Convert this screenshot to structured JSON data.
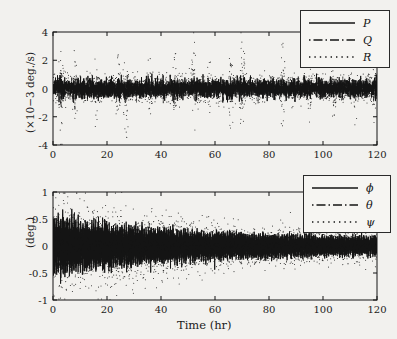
{
  "figure": {
    "background_color": "#f2f1ee",
    "ink_color": "#141414"
  },
  "xaxis": {
    "label": "Time (hr)",
    "ticks": [
      0,
      20,
      40,
      60,
      80,
      100,
      120
    ],
    "tick_labels": [
      "0",
      "20",
      "40",
      "60",
      "80",
      "100",
      "120"
    ],
    "min": 0,
    "max": 120
  },
  "top_panel": {
    "ylabel": "(×10−3 deg./s)",
    "ytick_labels": [
      "-4",
      "-2",
      "0",
      "2",
      "4"
    ],
    "legend": {
      "items": [
        {
          "label": "P",
          "style": "solid"
        },
        {
          "label": "Q",
          "style": "dashdot"
        },
        {
          "label": "R",
          "style": "dotted"
        }
      ]
    }
  },
  "bottom_panel": {
    "ylabel": "(deg.)",
    "ytick_labels": [
      "-1",
      "-0.5",
      "0",
      "0.5",
      "1"
    ],
    "legend": {
      "items": [
        {
          "label": "ϕ",
          "style": "solid"
        },
        {
          "label": "θ",
          "style": "dashdot"
        },
        {
          "label": "ψ",
          "style": "dotted"
        }
      ]
    }
  },
  "chart_data": [
    {
      "type": "line",
      "panel": "top",
      "title": "",
      "xlabel": "",
      "ylabel": "(×10−3 deg./s)",
      "xlim": [
        0,
        120
      ],
      "ylim": [
        -4,
        4
      ],
      "xticks": [
        0,
        20,
        40,
        60,
        80,
        100,
        120
      ],
      "yticks": [
        -4,
        -2,
        0,
        2,
        4
      ],
      "grid": false,
      "legend_position": "top-right-outside",
      "series": [
        {
          "name": "P",
          "style": "solid",
          "description": "dense zero-mean high-frequency noise band",
          "mean": 0.0,
          "envelope_amplitude": 0.75,
          "samples": 2400
        },
        {
          "name": "Q",
          "style": "dashdot",
          "description": "zero-mean noise with occasional moderate excursions",
          "mean": 0.0,
          "envelope_amplitude": 0.6,
          "samples": 2400
        },
        {
          "name": "R",
          "style": "dotted",
          "description": "zero-mean noise with periodic large spike clusters reaching +/-3.6",
          "mean": 0.0,
          "baseline_amplitude": 0.8,
          "spike_peak": 3.6,
          "spike_centers_hr": [
            3,
            8,
            16,
            24,
            27,
            36,
            45,
            52,
            58,
            66,
            70,
            85,
            95,
            104,
            112,
            119
          ],
          "spike_magnitudes": [
            3.6,
            2.3,
            1.6,
            2.6,
            3.3,
            2.2,
            2.0,
            2.6,
            1.5,
            2.6,
            3.6,
            2.3,
            2.2,
            2.0,
            1.6,
            1.7
          ],
          "samples": 2400
        }
      ]
    },
    {
      "type": "line",
      "panel": "bottom",
      "title": "",
      "xlabel": "Time (hr)",
      "ylabel": "(deg.)",
      "xlim": [
        0,
        120
      ],
      "ylim": [
        -1,
        1
      ],
      "xticks": [
        0,
        20,
        40,
        60,
        80,
        100,
        120
      ],
      "yticks": [
        -1,
        -0.5,
        0,
        0.5,
        1
      ],
      "grid": false,
      "legend_position": "top-right-outside",
      "series": [
        {
          "name": "ϕ",
          "style": "solid",
          "description": "decaying oscillation, dense vertical band",
          "envelope_start": 0.55,
          "envelope_end": 0.13,
          "decay_hr": 55,
          "samples": 2400
        },
        {
          "name": "θ",
          "style": "dashdot",
          "description": "decaying oscillation slightly smaller than phi",
          "envelope_start": 0.5,
          "envelope_end": 0.12,
          "decay_hr": 55,
          "samples": 2400
        },
        {
          "name": "ψ",
          "style": "dotted",
          "description": "decaying scatter with widest spread, reaching +/-0.95 early",
          "envelope_start": 0.95,
          "envelope_end": 0.18,
          "decay_hr": 45,
          "samples": 2400
        }
      ]
    }
  ]
}
